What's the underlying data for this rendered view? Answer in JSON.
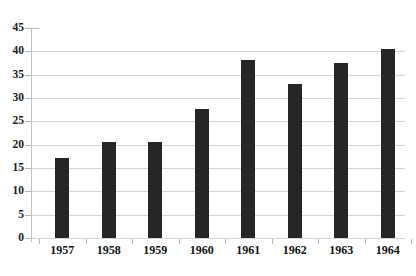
{
  "chart_data": {
    "type": "bar",
    "title": "",
    "subtitle": "",
    "xlabel": "",
    "ylabel": "",
    "categories": [
      "1957",
      "1958",
      "1959",
      "1960",
      "1961",
      "1962",
      "1963",
      "1964"
    ],
    "values": [
      17.2,
      20.6,
      20.6,
      27.7,
      38.1,
      33.0,
      37.4,
      40.5
    ],
    "series": [
      {
        "name": "",
        "values": [
          17.2,
          20.6,
          20.6,
          27.7,
          38.1,
          33.0,
          37.4,
          40.5
        ]
      }
    ],
    "ylim": [
      0,
      45
    ],
    "ytick_labels": [
      "0",
      "5",
      "10",
      "15",
      "20",
      "25",
      "30",
      "35",
      "40",
      "45"
    ],
    "ytick_values": [
      0,
      5,
      10,
      15,
      20,
      25,
      30,
      35,
      40,
      45
    ],
    "grid": true,
    "grid_axis": "y",
    "legend": false,
    "legend_position": "none",
    "bar_color": "#262626",
    "grid_color": "#d4d4d4",
    "axis_color": "#bfbfbf",
    "background_color": "#ffffff",
    "annotations": []
  },
  "artifact": {
    "top_edge_text": ""
  }
}
